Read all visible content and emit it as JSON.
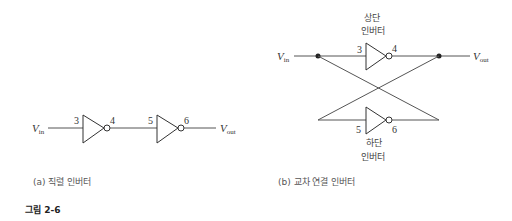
{
  "panel_a": {
    "input_label": "V",
    "input_sub": "in",
    "output_label": "V",
    "output_sub": "out",
    "inverter1": {
      "in_node": "3",
      "out_node": "4"
    },
    "inverter2": {
      "in_node": "5",
      "out_node": "6"
    },
    "caption": "(a) 직렬 인버터"
  },
  "panel_b": {
    "input_label": "V",
    "input_sub": "in",
    "output_label": "V",
    "output_sub": "out",
    "top_inverter": {
      "label_line1": "상단",
      "label_line2": "인버터",
      "in_node": "3",
      "out_node": "4"
    },
    "bottom_inverter": {
      "label_line1": "하단",
      "label_line2": "인버터",
      "in_node": "5",
      "out_node": "6"
    },
    "caption": "(b) 교차 연결 인버터"
  },
  "figure_label": "그림 2-6",
  "colors": {
    "line": "#555555",
    "text": "#333333"
  }
}
